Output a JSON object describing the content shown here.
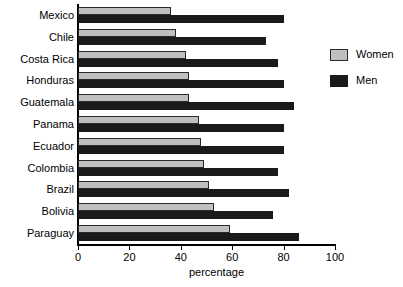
{
  "chart_data": {
    "type": "bar",
    "orientation": "horizontal",
    "title": "",
    "xlabel": "percentage",
    "ylabel": "",
    "xlim": [
      0,
      100
    ],
    "xticks": [
      0,
      20,
      40,
      60,
      80,
      100
    ],
    "grid": false,
    "legend_position": "right",
    "categories": [
      "Mexico",
      "Chile",
      "Costa Rica",
      "Honduras",
      "Guatemala",
      "Panama",
      "Ecuador",
      "Colombia",
      "Brazil",
      "Bolivia",
      "Paraguay"
    ],
    "series": [
      {
        "name": "Women",
        "color": "#bfbfbf",
        "values": [
          36,
          38,
          42,
          43,
          43,
          47,
          48,
          49,
          51,
          53,
          59
        ]
      },
      {
        "name": "Men",
        "color": "#1a1a1a",
        "values": [
          80,
          73,
          78,
          80,
          84,
          80,
          80,
          78,
          82,
          76,
          86
        ]
      }
    ]
  },
  "legend": {
    "items": [
      {
        "label": "Women",
        "swatch": "women"
      },
      {
        "label": "Men",
        "swatch": "men"
      }
    ]
  },
  "axis": {
    "x_title": "percentage",
    "tick_labels": [
      "0",
      "20",
      "40",
      "60",
      "80",
      "100"
    ]
  }
}
